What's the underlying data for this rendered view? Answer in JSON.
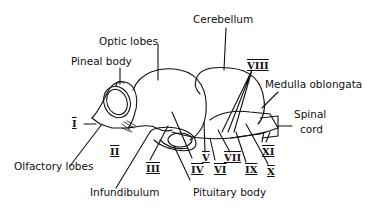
{
  "figure": {
    "labels": {
      "optic_lobes": "Optic lobes",
      "pineal_body": "Pineal body",
      "cerebellum": "Cerebellum",
      "medulla_oblongata": "Medulla oblongata",
      "spinal_cord_1": "Spinal",
      "spinal_cord_2": "cord",
      "olfactory_lobes": "Olfactory lobes",
      "infundibulum": "Infundibulum",
      "pituitary_body": "Pituitary body"
    },
    "cranial_nerves": {
      "I": "I",
      "II": "II",
      "III": "III",
      "IV": "IV",
      "V": "V",
      "VI": "VI",
      "VII": "VII",
      "VIII": "VIII",
      "IX": "IX",
      "X": "X",
      "XI": "XI"
    }
  }
}
